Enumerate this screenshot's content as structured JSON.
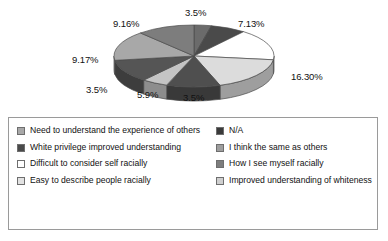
{
  "chart_data": {
    "type": "pie",
    "title": "",
    "subtitle": "",
    "xlabel": "",
    "ylabel": "",
    "grid": false,
    "legend_position": "bottom",
    "three_d": true,
    "labels_show_percent": true,
    "categories": [
      "N/A",
      "I think the same as others",
      "How I see myself racially",
      "Improved understanding of whiteness",
      "Easy to describe people racially",
      "Difficult to consider self racially",
      "White privilege improved understanding",
      "Need to understand the experience of others",
      "Need to understand the experience of others"
    ],
    "values": [
      3.5,
      7.13,
      16.3,
      3.5,
      5.9,
      3.5,
      9.17,
      9.16,
      3.5
    ],
    "slices": [
      {
        "label": "3.5%",
        "value": 3.5,
        "color": "#6b6b6b",
        "start_deg": 0,
        "end_deg": 12.6
      },
      {
        "label": "7.13%",
        "value": 7.13,
        "color": "#4a4a4a",
        "start_deg": 12.6,
        "end_deg": 38.3
      },
      {
        "label": "16.30%",
        "value": 16.3,
        "color": "#ffffff",
        "start_deg": 38.3,
        "end_deg": 97.0
      },
      {
        "label": "3.5%",
        "value": 3.5,
        "color": "#dcdcdc",
        "start_deg": 97.0,
        "end_deg": 161.0
      },
      {
        "label": "5.9%",
        "value": 5.9,
        "color": "#4f4f4f",
        "start_deg": 161.0,
        "end_deg": 200.0
      },
      {
        "label": "3.5%",
        "value": 3.5,
        "color": "#c4c4c4",
        "start_deg": 200.0,
        "end_deg": 219.0
      },
      {
        "label": "9.17%",
        "value": 9.17,
        "color": "#555555",
        "start_deg": 219.0,
        "end_deg": 262.0
      },
      {
        "label": "9.16%",
        "value": 9.16,
        "color": "#a8a8a8",
        "start_deg": 262.0,
        "end_deg": 318.0
      },
      {
        "label": "3.5%",
        "value": 3.5,
        "color": "#7d7d7d",
        "start_deg": 318.0,
        "end_deg": 360.0
      }
    ],
    "data_labels": [
      {
        "text": "3.5%",
        "x": 185,
        "y": 7
      },
      {
        "text": "7.13%",
        "x": 238,
        "y": 18
      },
      {
        "text": "16.30%",
        "x": 291,
        "y": 71
      },
      {
        "text": "3.5%",
        "x": 183,
        "y": 92
      },
      {
        "text": "5.9%",
        "x": 137,
        "y": 89
      },
      {
        "text": "3.5%",
        "x": 86,
        "y": 84
      },
      {
        "text": "9.17%",
        "x": 72,
        "y": 54
      },
      {
        "text": "9.16%",
        "x": 113,
        "y": 18
      }
    ]
  },
  "legend": {
    "left_column": [
      {
        "label": "Need to understand the experience of others",
        "color": "#a8a8a8"
      },
      {
        "label": "White privilege improved understanding",
        "color": "#4a4a4a"
      },
      {
        "label": "Difficult to consider self racially",
        "color": "#ffffff"
      },
      {
        "label": "Easy to describe people racially",
        "color": "#e2e2e2"
      }
    ],
    "right_column": [
      {
        "label": "N/A",
        "color": "#3a3a3a"
      },
      {
        "label": "I think the same as others",
        "color": "#9e9e9e"
      },
      {
        "label": "How I see myself racially",
        "color": "#7d7d7d"
      },
      {
        "label": "Improved understanding of whiteness",
        "color": "#cfcfcf"
      }
    ]
  },
  "colors": {
    "border": "#9a9a9a",
    "background": "#ffffff",
    "text": "#111111",
    "outline": "#4a4a4a"
  }
}
